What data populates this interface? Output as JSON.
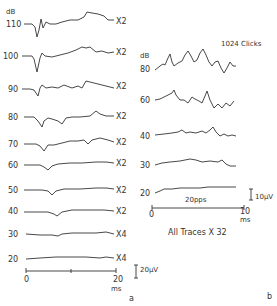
{
  "panel_a": {
    "unit_label": "dB",
    "traces": [
      {
        "level": "110",
        "gain": "X2"
      },
      {
        "level": "100",
        "gain": "X2"
      },
      {
        "level": "90",
        "gain": "X2"
      },
      {
        "level": "80",
        "gain": "X2"
      },
      {
        "level": "70",
        "gain": "X2"
      },
      {
        "level": "60",
        "gain": "X2"
      },
      {
        "level": "50",
        "gain": "X2"
      },
      {
        "level": "40",
        "gain": "X2"
      },
      {
        "level": "30",
        "gain": "X4"
      },
      {
        "level": "20",
        "gain": "X4"
      }
    ],
    "time_axis": {
      "start": "0",
      "end": "20",
      "unit": "ms"
    },
    "amplitude_scale": "20µV",
    "panel_label": "a"
  },
  "panel_b": {
    "unit_label": "dB",
    "title": "1024  Clicks",
    "traces": [
      {
        "level": "80"
      },
      {
        "level": "60"
      },
      {
        "level": "40"
      },
      {
        "level": "30"
      },
      {
        "level": "20"
      }
    ],
    "rate_label": "20pps",
    "amplitude_scale": "10µV",
    "time_axis": {
      "start": "0",
      "end": "10",
      "unit": "ms"
    },
    "footnote": "All Traces X 32",
    "panel_label": "b"
  }
}
